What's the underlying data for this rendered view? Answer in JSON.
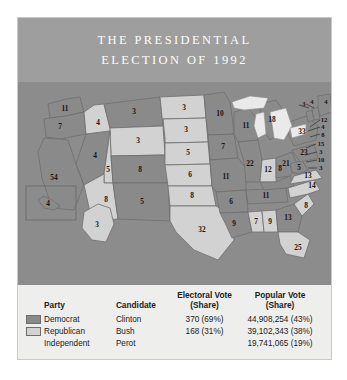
{
  "title": {
    "line1": "THE PRESIDENTIAL",
    "line2": "ELECTION OF 1992"
  },
  "colors": {
    "democrat": "#8a8a8a",
    "republican": "#d2d2d2",
    "panel": "#9a9a9a",
    "title_band": "#9e9e9e",
    "map_water": "#8c8c8c",
    "lake": "#eaeaea",
    "table_bg": "#eeeeec",
    "title_text": "#fdfdfd"
  },
  "legend_table": {
    "headers": {
      "party": "Party",
      "candidate": "Candidate",
      "electoral_line1": "Electoral Vote",
      "electoral_line2": "(Share)",
      "popular_line1": "Popular Vote",
      "popular_line2": "(Share)"
    },
    "rows": [
      {
        "swatch": "democrat",
        "party": "Democrat",
        "candidate": "Clinton",
        "electoral": "370 (69%)",
        "popular": "44,908,254 (43%)"
      },
      {
        "swatch": "republican",
        "party": "Republican",
        "candidate": "Bush",
        "electoral": "168 (31%)",
        "popular": "39,102,343 (38%)"
      },
      {
        "swatch": "none",
        "party": "Independent",
        "candidate": "Perot",
        "electoral": "",
        "popular": "19,741,065 (19%)"
      }
    ]
  },
  "map_data": {
    "type": "choropleth",
    "description": "1992 United States presidential election electoral vote map by state",
    "states": [
      {
        "code": "WA",
        "ev": "11",
        "party": "democrat"
      },
      {
        "code": "OR",
        "ev": "7",
        "party": "democrat"
      },
      {
        "code": "CA",
        "ev": "54",
        "party": "democrat"
      },
      {
        "code": "NV",
        "ev": "4",
        "party": "democrat"
      },
      {
        "code": "ID",
        "ev": "4",
        "party": "republican"
      },
      {
        "code": "MT",
        "ev": "3",
        "party": "democrat"
      },
      {
        "code": "WY",
        "ev": "3",
        "party": "republican"
      },
      {
        "code": "UT",
        "ev": "5",
        "party": "republican"
      },
      {
        "code": "AZ",
        "ev": "8",
        "party": "republican"
      },
      {
        "code": "CO",
        "ev": "8",
        "party": "democrat"
      },
      {
        "code": "NM",
        "ev": "5",
        "party": "democrat"
      },
      {
        "code": "ND",
        "ev": "3",
        "party": "republican"
      },
      {
        "code": "SD",
        "ev": "3",
        "party": "republican"
      },
      {
        "code": "NE",
        "ev": "5",
        "party": "republican"
      },
      {
        "code": "KS",
        "ev": "6",
        "party": "republican"
      },
      {
        "code": "OK",
        "ev": "8",
        "party": "republican"
      },
      {
        "code": "TX",
        "ev": "32",
        "party": "republican"
      },
      {
        "code": "MN",
        "ev": "10",
        "party": "democrat"
      },
      {
        "code": "IA",
        "ev": "7",
        "party": "democrat"
      },
      {
        "code": "MO",
        "ev": "11",
        "party": "democrat"
      },
      {
        "code": "AR",
        "ev": "6",
        "party": "democrat"
      },
      {
        "code": "LA",
        "ev": "9",
        "party": "democrat"
      },
      {
        "code": "WI",
        "ev": "11",
        "party": "democrat"
      },
      {
        "code": "IL",
        "ev": "22",
        "party": "democrat"
      },
      {
        "code": "MS",
        "ev": "7",
        "party": "republican"
      },
      {
        "code": "MI",
        "ev": "18",
        "party": "democrat"
      },
      {
        "code": "IN",
        "ev": "12",
        "party": "republican"
      },
      {
        "code": "AL",
        "ev": "9",
        "party": "republican"
      },
      {
        "code": "TN",
        "ev": "11",
        "party": "democrat"
      },
      {
        "code": "KY",
        "ev": "8",
        "party": "democrat"
      },
      {
        "code": "OH",
        "ev": "21",
        "party": "democrat"
      },
      {
        "code": "GA",
        "ev": "13",
        "party": "democrat"
      },
      {
        "code": "FL",
        "ev": "25",
        "party": "republican"
      },
      {
        "code": "SC",
        "ev": "8",
        "party": "republican"
      },
      {
        "code": "NC",
        "ev": "14",
        "party": "republican"
      },
      {
        "code": "VA",
        "ev": "13",
        "party": "republican"
      },
      {
        "code": "WV",
        "ev": "5",
        "party": "democrat"
      },
      {
        "code": "PA",
        "ev": "23",
        "party": "democrat"
      },
      {
        "code": "NY",
        "ev": "33",
        "party": "democrat"
      },
      {
        "code": "VT",
        "ev": "3",
        "party": "democrat"
      },
      {
        "code": "NH",
        "ev": "4",
        "party": "democrat"
      },
      {
        "code": "ME",
        "ev": "4",
        "party": "democrat"
      },
      {
        "code": "MA",
        "ev": "12",
        "party": "democrat"
      },
      {
        "code": "RI",
        "ev": "4",
        "party": "democrat"
      },
      {
        "code": "CT",
        "ev": "8",
        "party": "democrat"
      },
      {
        "code": "NJ",
        "ev": "15",
        "party": "democrat"
      },
      {
        "code": "DE",
        "ev": "3",
        "party": "democrat"
      },
      {
        "code": "MD",
        "ev": "10",
        "party": "democrat"
      },
      {
        "code": "DC",
        "ev": "3",
        "party": "democrat"
      },
      {
        "code": "AK",
        "ev": "3",
        "party": "republican"
      },
      {
        "code": "HI",
        "ev": "4",
        "party": "democrat"
      }
    ]
  }
}
